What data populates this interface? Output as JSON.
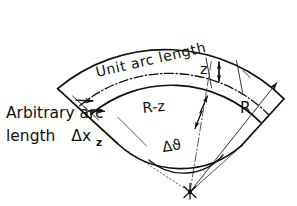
{
  "figure": {
    "kind": "annular-sector-geometry-diagram",
    "background_color": "#ffffff",
    "ink_color": "#111111"
  },
  "labels": {
    "unit_arc_length": "Unit  arc  length",
    "arbitrary_arc_line1": "Arbitrary arc",
    "arbitrary_arc_line2_prefix": "length",
    "arbitrary_arc_symbol": "Δx",
    "arbitrary_arc_subscript": "z",
    "radius_outer": "R",
    "radius_inner": "R-z",
    "offset": "z",
    "angle": "Δϑ"
  },
  "geometry": {
    "apex_x": 190,
    "apex_y": 192,
    "radius_outer_px": 168,
    "radius_unit_arc_px": 140,
    "radius_band_top_px": 126,
    "radius_band_bottom_px": 92,
    "angle_start_deg": -142,
    "angle_end_deg": -56,
    "angle_arc_radius_px": 52
  },
  "icons": {
    "arrowhead": "arrow-head",
    "apex_marker": "apex-star-marker"
  }
}
